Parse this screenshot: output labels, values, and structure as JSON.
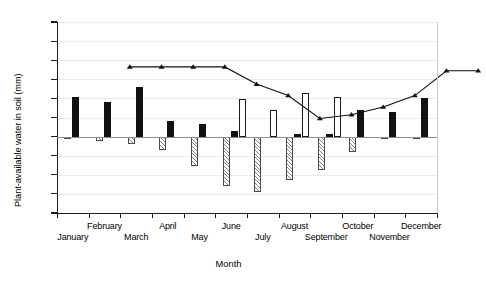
{
  "chart_data": {
    "type": "bar",
    "title": "",
    "xlabel": "Month",
    "ylabel": "Plant-available water in soil (mm)",
    "ylim": [
      -20,
      30
    ],
    "yticks": [
      -20,
      -15,
      -10,
      -5,
      0,
      5,
      10,
      15,
      20,
      25,
      30
    ],
    "ytick_labels": [
      "−20",
      "−15",
      "−10",
      "−5",
      "0",
      "5",
      "10",
      "15",
      "20",
      "25",
      "30"
    ],
    "grid": true,
    "legend": "none",
    "categories": [
      "January",
      "February",
      "March",
      "April",
      "May",
      "June",
      "July",
      "August",
      "September",
      "October",
      "November",
      "December"
    ],
    "series": [
      {
        "name": "gain-bar",
        "style": "filled-black",
        "values": [
          10.5,
          9.0,
          13.0,
          4.1,
          3.3,
          1.4,
          0.0,
          0.8,
          0.6,
          7.0,
          6.4,
          10.2
        ]
      },
      {
        "name": "drainage-bar",
        "style": "open-white",
        "values": [
          0,
          0,
          0,
          0,
          0,
          9.8,
          6.9,
          11.4,
          10.3,
          0,
          0,
          0
        ]
      },
      {
        "name": "loss-bar",
        "style": "hatched",
        "values": [
          -0.6,
          -1.1,
          -2.0,
          -3.5,
          -7.7,
          -13.0,
          -14.4,
          -11.3,
          -8.8,
          -4.1,
          -0.5,
          -0.4
        ]
      }
    ],
    "line_series": {
      "name": "soil-water-line",
      "marker": "triangle",
      "values": [
        24.0,
        24.0,
        24.0,
        24.0,
        19.5,
        16.5,
        10.5,
        11.5,
        13.5,
        16.5,
        23.0,
        23.0
      ]
    }
  },
  "axis": {
    "y_title": "Plant-available water in soil (mm)",
    "x_title": "Month"
  }
}
